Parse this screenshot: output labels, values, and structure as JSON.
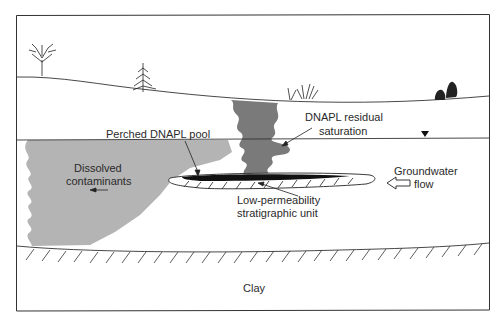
{
  "diagram": {
    "type": "cross-section",
    "colors": {
      "frame": "#333333",
      "dissolved_plume": "#b4b4b4",
      "dnapl_residual": "#7a7a7a",
      "dnapl_pool": "#111111",
      "background": "#ffffff"
    },
    "labels": {
      "perched_pool": "Perched DNAPL pool",
      "residual_line1": "DNAPL residual",
      "residual_line2": "saturation",
      "dissolved_line1": "Dissolved",
      "dissolved_line2": "contaminants",
      "low_perm_line1": "Low-permeability",
      "low_perm_line2": "stratigraphic unit",
      "groundwater_line1": "Groundwater",
      "groundwater_line2": "flow",
      "clay": "Clay"
    },
    "symbols": {
      "water_table": "water-table-triangle",
      "flow_direction": "left"
    }
  }
}
